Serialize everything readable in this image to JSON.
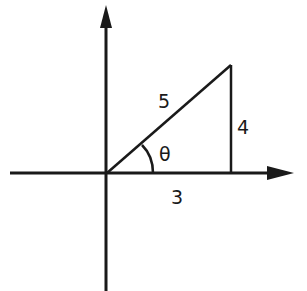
{
  "diagram": {
    "labels": {
      "hypotenuse": "5",
      "opposite": "4",
      "adjacent": "3",
      "angle": "θ"
    },
    "colors": {
      "stroke": "#1a1a1a",
      "background": "#ffffff"
    }
  }
}
